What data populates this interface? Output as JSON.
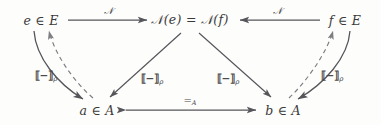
{
  "diagram": {
    "type": "commutative-diagram",
    "stroke_color": "#55555a",
    "text_color": "#3a3a3a",
    "background": "#fdfdfc",
    "nodes": [
      {
        "id": "e-in-E",
        "label": "e ∈ E",
        "x": 41,
        "y": 20
      },
      {
        "id": "N-e-equals-N-f",
        "label": "𝒩(e) = 𝒩(f)",
        "x": 190,
        "y": 20
      },
      {
        "id": "f-in-E",
        "label": "f ∈ E",
        "x": 345,
        "y": 20
      },
      {
        "id": "a-in-A",
        "label": "a ∈ A",
        "x": 97,
        "y": 110
      },
      {
        "id": "b-in-A",
        "label": "b ∈ A",
        "x": 283,
        "y": 110
      }
    ],
    "arrows": [
      {
        "id": "e-to-N",
        "label": "𝒩",
        "from": "e-in-E",
        "to": "N-e-equals-N-f",
        "style": "solid",
        "label_x": 108,
        "label_y": 11
      },
      {
        "id": "f-to-N",
        "label": "𝒩",
        "from": "f-in-E",
        "to": "N-e-equals-N-f",
        "style": "solid",
        "label_x": 277,
        "label_y": 11
      },
      {
        "id": "N-to-a",
        "label": "⟦−⟧",
        "sub": "ρ",
        "from": "N-e-equals-N-f",
        "to": "a-in-A",
        "style": "solid",
        "label_x": 152,
        "label_y": 79
      },
      {
        "id": "N-to-b",
        "label": "⟦−⟧",
        "sub": "ρ",
        "from": "N-e-equals-N-f",
        "to": "b-in-A",
        "style": "solid",
        "label_x": 228,
        "label_y": 79
      },
      {
        "id": "e-to-a-curved",
        "label": "⟦−⟧",
        "sub": "ρ",
        "from": "e-in-E",
        "to": "a-in-A",
        "style": "solid",
        "label_x": 46,
        "label_y": 76
      },
      {
        "id": "f-to-b-curved",
        "label": "⟦−⟧",
        "sub": "ρ",
        "from": "f-in-E",
        "to": "b-in-A",
        "style": "solid",
        "label_x": 332,
        "label_y": 76
      },
      {
        "id": "a-to-e-dashed",
        "label": "",
        "from": "a-in-A",
        "to": "e-in-E",
        "style": "dashed"
      },
      {
        "id": "b-to-f-dashed",
        "label": "",
        "from": "b-in-A",
        "to": "f-in-E",
        "style": "dashed"
      },
      {
        "id": "a-equals-b",
        "label": "=",
        "sub": "A",
        "from": "a-in-A",
        "to": "b-in-A",
        "style": "solid-bidirectional",
        "label_x": 190,
        "label_y": 101
      }
    ]
  }
}
